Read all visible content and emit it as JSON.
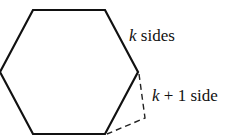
{
  "diagram": {
    "polygon_label": {
      "var": "k",
      "text": " sides"
    },
    "extended_label": {
      "var": "k",
      "text": " + 1 side"
    },
    "stroke_color": "#111111"
  }
}
